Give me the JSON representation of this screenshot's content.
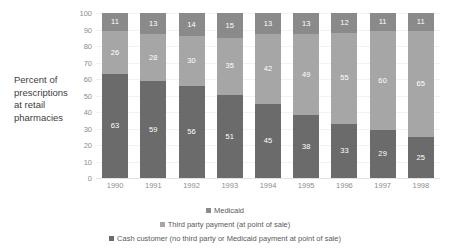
{
  "chart_data": {
    "type": "bar",
    "subtype": "stacked-bar-100-percent",
    "title": "",
    "xlabel": "",
    "ylabel": "Percent of prescriptions at retail pharmacies",
    "ylim": [
      0,
      100
    ],
    "ytick_step": 10,
    "grid": true,
    "legend_position": "bottom",
    "categories": [
      "1990",
      "1991",
      "1992",
      "1993",
      "1994",
      "1995",
      "1996",
      "1997",
      "1998"
    ],
    "yticks": [
      "0",
      "10",
      "20",
      "30",
      "40",
      "50",
      "60",
      "70",
      "80",
      "90",
      "100"
    ],
    "series": [
      {
        "name": "Cash customer (no third party or Medicaid payment at point of sale)",
        "short_name": "Cash customer",
        "color": "#6b6b6b",
        "stack_order": 0,
        "values": [
          63,
          59,
          56,
          51,
          45,
          38,
          33,
          29,
          25
        ]
      },
      {
        "name": "Third party payment (at point of sale)",
        "short_name": "Third party payment",
        "color": "#a6a6a6",
        "stack_order": 1,
        "values": [
          26,
          28,
          30,
          35,
          42,
          49,
          55,
          60,
          65
        ]
      },
      {
        "name": "Medicaid",
        "short_name": "Medicaid",
        "color": "#8a8a8a",
        "stack_order": 2,
        "values": [
          11,
          13,
          14,
          15,
          13,
          13,
          12,
          11,
          11
        ]
      }
    ]
  },
  "y_axis_title_lines": [
    "Percent of",
    "prescriptions",
    "at retail",
    "pharmacies"
  ],
  "legend": {
    "entries": [
      {
        "label": "Medicaid",
        "color": "#8a8a8a"
      },
      {
        "label": "Third party payment (at point of sale)",
        "color": "#a6a6a6"
      },
      {
        "label": "Cash customer (no third party or Medicaid payment at point of sale)",
        "color": "#6b6b6b"
      }
    ]
  }
}
